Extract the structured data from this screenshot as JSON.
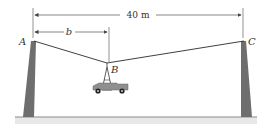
{
  "diagram": {
    "span_label": "40 m",
    "offset_label": "b",
    "points": {
      "A": "A",
      "B": "B",
      "C": "C"
    },
    "colors": {
      "pole": "#6e6e6e",
      "cable": "#2a2a2a",
      "ground": "#8a8a8a",
      "ground_band": "#e6e6e6",
      "car": "#8f8f8f",
      "dimension": "#555555"
    }
  }
}
